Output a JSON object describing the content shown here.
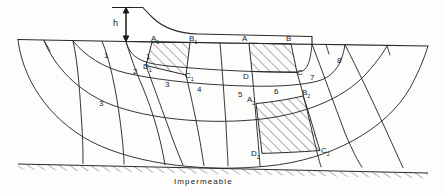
{
  "figure": {
    "type": "flow-net-seepage-diagram",
    "head_label": "h",
    "foundation_label": "Impermeable",
    "ink_color": "#2a2a2a",
    "hatch_color": "#3a3a3a"
  },
  "zones": [
    {
      "id": "zone-1-left",
      "label": "1",
      "x": 107,
      "y": 57
    },
    {
      "id": "zone-1-right",
      "label": "1",
      "x": 148,
      "y": 58
    },
    {
      "id": "zone-2",
      "label": "2",
      "x": 136,
      "y": 73
    },
    {
      "id": "zone-3-left",
      "label": "3",
      "x": 102,
      "y": 105
    },
    {
      "id": "zone-3-mid",
      "label": "3",
      "x": 168,
      "y": 86
    },
    {
      "id": "zone-4",
      "label": "4",
      "x": 200,
      "y": 91
    },
    {
      "id": "zone-5",
      "label": "5",
      "x": 241,
      "y": 96
    },
    {
      "id": "zone-6",
      "label": "6",
      "x": 277,
      "y": 93
    },
    {
      "id": "zone-7",
      "label": "7",
      "x": 313,
      "y": 79
    },
    {
      "id": "zone-8",
      "label": "8",
      "x": 340,
      "y": 62
    }
  ],
  "points": [
    {
      "id": "point-A1",
      "base": "A",
      "sub": "1",
      "x": 154,
      "y": 41
    },
    {
      "id": "point-B1",
      "base": "B",
      "sub": "1",
      "x": 192,
      "y": 41
    },
    {
      "id": "point-A",
      "base": "A",
      "sub": "",
      "x": 245,
      "y": 41
    },
    {
      "id": "point-B",
      "base": "B",
      "sub": "",
      "x": 289,
      "y": 41
    },
    {
      "id": "point-D1",
      "base": "D",
      "sub": "1",
      "x": 146,
      "y": 68
    },
    {
      "id": "point-C1",
      "base": "C",
      "sub": "1",
      "x": 188,
      "y": 77
    },
    {
      "id": "point-D",
      "base": "D",
      "sub": "",
      "x": 246,
      "y": 78
    },
    {
      "id": "point-C",
      "base": "C",
      "sub": "",
      "x": 300,
      "y": 74
    },
    {
      "id": "point-A2",
      "base": "A",
      "sub": "2",
      "x": 250,
      "y": 101
    },
    {
      "id": "point-B2",
      "base": "B",
      "sub": "2",
      "x": 305,
      "y": 94
    },
    {
      "id": "point-D2",
      "base": "D",
      "sub": "2",
      "x": 254,
      "y": 155
    },
    {
      "id": "point-C2",
      "base": "C",
      "sub": "2",
      "x": 324,
      "y": 152
    }
  ],
  "head_dimension": {
    "label": "h",
    "label_x": 117,
    "label_y": 19,
    "line_x": 126,
    "top_y": 7,
    "bottom_y": 42
  },
  "foundation": {
    "label": "Impermeable",
    "label_x": 176,
    "label_y": 180,
    "line_left_x": 18,
    "line_left_y": 164,
    "line_right_x": 428,
    "line_right_y": 173
  }
}
